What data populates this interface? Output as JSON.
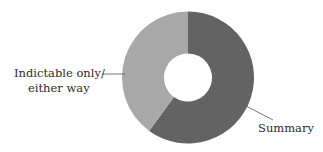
{
  "chart_data": {
    "type": "pie",
    "variant": "donut",
    "title": "",
    "categories": [
      "Summary",
      "Indictable only/ either way"
    ],
    "values": [
      60,
      40
    ],
    "unit": "percent (estimated from slice angles)",
    "series": [
      {
        "name": "Summary",
        "value": 60,
        "color": "#636363"
      },
      {
        "name": "Indictable only/either way",
        "value": 40,
        "color": "#a8a8a8"
      }
    ],
    "start_angle": "12 o'clock, clockwise",
    "legend": "none (direct labels with leader lines)",
    "labels": {
      "summary": "Summary",
      "indictable_line1": "Indictable only/",
      "indictable_line2": "either way"
    }
  },
  "colors": {
    "summary": "#636363",
    "indictable": "#a8a8a8",
    "leader": "#555555",
    "text": "#2a2a2a"
  }
}
